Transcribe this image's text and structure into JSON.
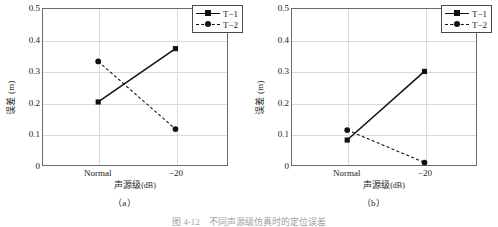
{
  "figure": {
    "caption": "图 4-12　不同声源级仿真时的定位误差",
    "panels": [
      {
        "sublabel": "（a）"
      },
      {
        "sublabel": "（b）"
      }
    ]
  },
  "axis": {
    "ylabel": "误差 (m)",
    "xlabel_text": "声源级",
    "xlabel_unit": "(dB)",
    "yticks": [
      "0",
      "0.1",
      "0.2",
      "0.3",
      "0.4",
      "0.5"
    ],
    "xticks": [
      "Normal",
      "−20"
    ]
  },
  "legend": {
    "position": "top-right",
    "entries": [
      {
        "label": "T−1",
        "style": "solid",
        "marker": "square"
      },
      {
        "label": "T−2",
        "style": "dashed",
        "marker": "circle"
      }
    ]
  },
  "colors": {
    "line": "#111111",
    "grid": "#d9d9d9",
    "frame": "#6b6b6b",
    "background": "#ffffff"
  },
  "chart_data": [
    {
      "type": "line",
      "title": "（a）",
      "xlabel": "声源级(dB)",
      "ylabel": "误差 (m)",
      "categories": [
        "Normal",
        "−20"
      ],
      "ylim": [
        0,
        0.5
      ],
      "yticks": [
        0,
        0.1,
        0.2,
        0.3,
        0.4,
        0.5
      ],
      "grid": true,
      "legend_position": "top-right",
      "series": [
        {
          "name": "T−1",
          "values": [
            0.202,
            0.373
          ],
          "style": "solid",
          "marker": "square"
        },
        {
          "name": "T−2",
          "values": [
            0.332,
            0.115
          ],
          "style": "dashed",
          "marker": "circle"
        }
      ]
    },
    {
      "type": "line",
      "title": "（b）",
      "xlabel": "声源级(dB)",
      "ylabel": "误差 (m)",
      "categories": [
        "Normal",
        "−20"
      ],
      "ylim": [
        0,
        0.5
      ],
      "yticks": [
        0,
        0.1,
        0.2,
        0.3,
        0.4,
        0.5
      ],
      "grid": true,
      "legend_position": "top-right",
      "series": [
        {
          "name": "T−1",
          "values": [
            0.08,
            0.3
          ],
          "style": "solid",
          "marker": "square"
        },
        {
          "name": "T−2",
          "values": [
            0.112,
            0.008
          ],
          "style": "dashed",
          "marker": "circle"
        }
      ]
    }
  ]
}
